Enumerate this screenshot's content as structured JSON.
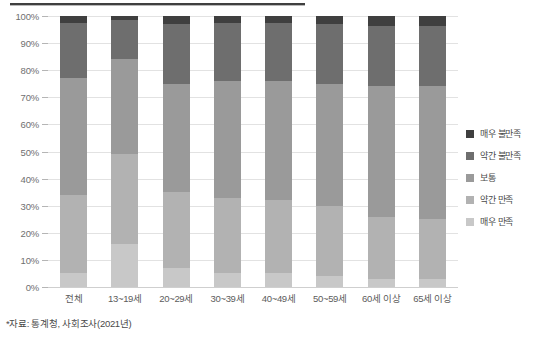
{
  "chart_data": {
    "type": "bar",
    "subtype": "stacked-100-percent",
    "title": "",
    "xlabel": "",
    "ylabel": "",
    "ylim": [
      0,
      100
    ],
    "ytick_labels": [
      "100%",
      "90%",
      "80%",
      "70%",
      "60%",
      "50%",
      "40%",
      "30%",
      "20%",
      "10%",
      "0%"
    ],
    "ytick_values": [
      100,
      90,
      80,
      70,
      60,
      50,
      40,
      30,
      20,
      10,
      0
    ],
    "grid": true,
    "legend_position": "right",
    "categories": [
      "전체",
      "13~19세",
      "20~29세",
      "30~39세",
      "40~49세",
      "50~59세",
      "60세 이상",
      "65세 이상"
    ],
    "series": [
      {
        "name": "매우 만족",
        "color": "#c8c8c8",
        "values": [
          5.0,
          16.0,
          7.0,
          5.0,
          5.0,
          4.0,
          3.0,
          3.0
        ]
      },
      {
        "name": "약간 만족",
        "color": "#b2b2b2",
        "values": [
          29.0,
          33.0,
          28.0,
          28.0,
          27.0,
          26.0,
          23.0,
          22.0
        ]
      },
      {
        "name": "보통",
        "color": "#9a9a9a",
        "values": [
          43.0,
          35.0,
          40.0,
          43.0,
          44.0,
          45.0,
          48.0,
          49.0
        ]
      },
      {
        "name": "약간 불만족",
        "color": "#6e6e6e",
        "values": [
          20.5,
          14.5,
          22.0,
          21.5,
          21.5,
          22.0,
          22.5,
          22.5
        ]
      },
      {
        "name": "매우 불만족",
        "color": "#3f3f3f",
        "values": [
          2.5,
          1.5,
          3.0,
          2.5,
          2.5,
          3.0,
          3.5,
          3.5
        ]
      }
    ]
  },
  "legend": {
    "items": [
      {
        "label": "매우 불만족",
        "color": "#3f3f3f"
      },
      {
        "label": "약간 불만족",
        "color": "#6e6e6e"
      },
      {
        "label": "보통",
        "color": "#9a9a9a"
      },
      {
        "label": "약간 만족",
        "color": "#b2b2b2"
      },
      {
        "label": "매우 만족",
        "color": "#c8c8c8"
      }
    ]
  },
  "footnote": {
    "text": "*자료: 통계청, 사회조사(2021년)"
  }
}
